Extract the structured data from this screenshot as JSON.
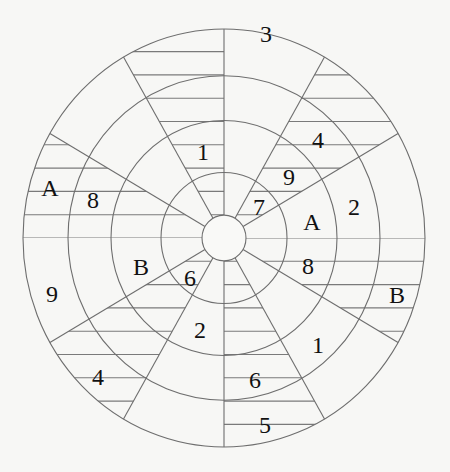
{
  "diagram": {
    "type": "polar-grid-puzzle",
    "center": [
      224,
      238
    ],
    "radius_x": 201,
    "radius_y": 209,
    "ring_radii_x": [
      201,
      156,
      113,
      63,
      22
    ],
    "spoke_angles_deg": [
      90,
      60,
      30,
      -30,
      -60,
      -90,
      -120,
      -150,
      150,
      120
    ],
    "hatched_wedges_deg": [
      [
        30,
        60
      ],
      [
        90,
        120
      ],
      [
        150,
        180
      ],
      [
        210,
        240
      ],
      [
        270,
        300
      ],
      [
        330,
        360
      ]
    ],
    "hatch_spacing": 23.3,
    "colors": {
      "line": "#6e6e6e",
      "text": "#111111",
      "background": "#f7f7f5"
    }
  },
  "labels": [
    {
      "text": "3",
      "x": 266,
      "y": 34
    },
    {
      "text": "1",
      "x": 203,
      "y": 152
    },
    {
      "text": "4",
      "x": 318,
      "y": 140
    },
    {
      "text": "9",
      "x": 289,
      "y": 177
    },
    {
      "text": "A",
      "x": 50,
      "y": 188
    },
    {
      "text": "8",
      "x": 93,
      "y": 200
    },
    {
      "text": "7",
      "x": 259,
      "y": 207
    },
    {
      "text": "2",
      "x": 354,
      "y": 207
    },
    {
      "text": "A",
      "x": 312,
      "y": 222
    },
    {
      "text": "B",
      "x": 141,
      "y": 267
    },
    {
      "text": "8",
      "x": 308,
      "y": 266
    },
    {
      "text": "6",
      "x": 190,
      "y": 278
    },
    {
      "text": "9",
      "x": 52,
      "y": 294
    },
    {
      "text": "B",
      "x": 397,
      "y": 295
    },
    {
      "text": "2",
      "x": 200,
      "y": 330
    },
    {
      "text": "1",
      "x": 318,
      "y": 345
    },
    {
      "text": "4",
      "x": 98,
      "y": 377
    },
    {
      "text": "6",
      "x": 255,
      "y": 380
    },
    {
      "text": "5",
      "x": 265,
      "y": 425
    }
  ]
}
